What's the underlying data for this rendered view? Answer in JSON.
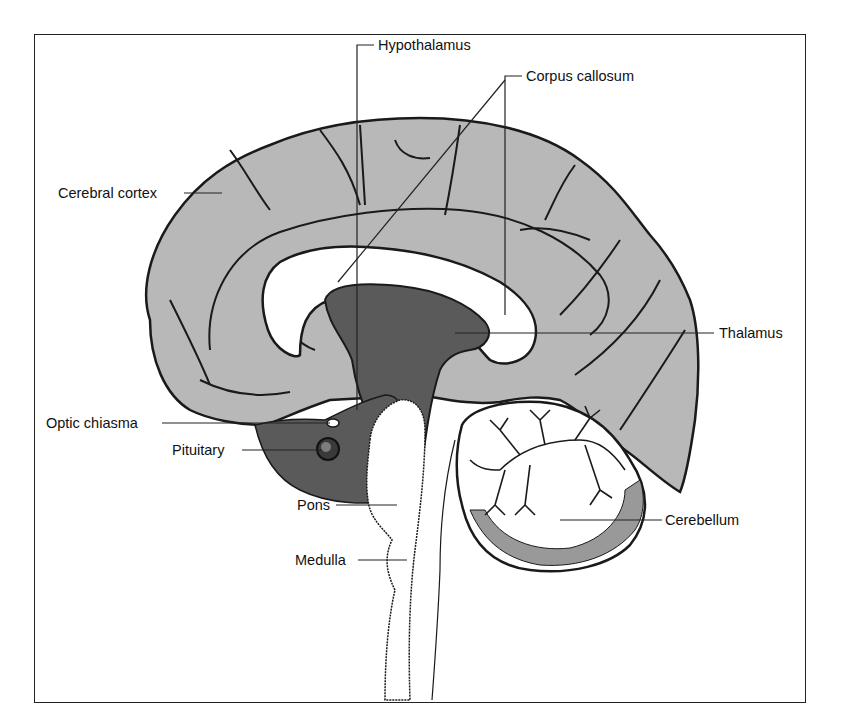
{
  "figure": {
    "colors": {
      "background": "#ffffff",
      "frame": "#222222",
      "cortex_fill": "#b8b8b8",
      "deep_structure_fill": "#5a5a5a",
      "white_matter": "#ffffff",
      "outline": "#1a1a1a",
      "leader_line": "#222222"
    }
  },
  "labels": {
    "hypothalamus": "Hypothalamus",
    "corpus_callosum": "Corpus callosum",
    "cerebral_cortex": "Cerebral cortex",
    "thalamus": "Thalamus",
    "optic_chiasma": "Optic chiasma",
    "pituitary": "Pituitary",
    "pons": "Pons",
    "medulla": "Medulla",
    "cerebellum": "Cerebellum"
  }
}
